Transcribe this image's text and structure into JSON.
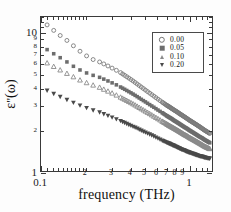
{
  "figure": {
    "background": "#ffffff",
    "frame_color": "#3a3a3a"
  },
  "axes": {
    "x_title": "frequency (THz)",
    "y_title_base": "ε",
    "y_title_prime": "\"",
    "y_title_arg": "(ω)",
    "x_scale": "log",
    "y_scale": "log",
    "xlim": [
      0.1,
      1.45
    ],
    "ylim": [
      1.0,
      13.0
    ],
    "x_major_ticks": [
      {
        "value": 0.1,
        "label": "0.1"
      },
      {
        "value": 1.0,
        "label": "1"
      }
    ],
    "x_minor_ticks": [
      {
        "value": 0.2,
        "label": "2"
      },
      {
        "value": 0.3,
        "label": "3"
      },
      {
        "value": 0.4,
        "label": "4"
      },
      {
        "value": 0.5,
        "label": "5"
      },
      {
        "value": 0.6,
        "label": "6"
      },
      {
        "value": 0.7,
        "label": "7"
      },
      {
        "value": 0.8,
        "label": "8"
      },
      {
        "value": 0.9,
        "label": "9"
      }
    ],
    "y_major_ticks": [
      {
        "value": 1,
        "label": "1"
      },
      {
        "value": 10,
        "label": "10"
      }
    ],
    "y_minor_ticks": [
      {
        "value": 2,
        "label": "2"
      },
      {
        "value": 3,
        "label": "3"
      },
      {
        "value": 4,
        "label": "4"
      },
      {
        "value": 5,
        "label": "5"
      },
      {
        "value": 6,
        "label": "6"
      },
      {
        "value": 7,
        "label": "7"
      },
      {
        "value": 8,
        "label": "8"
      },
      {
        "value": 9,
        "label": "9"
      }
    ]
  },
  "legend": {
    "position": "top-right",
    "entries": [
      {
        "label": "0.00",
        "marker": "open-circle",
        "color": "#7a7a7a"
      },
      {
        "label": "0.05",
        "marker": "filled-square",
        "color": "#6d6d6d"
      },
      {
        "label": "0.10",
        "marker": "open-triangle-up",
        "color": "#8a8a8a"
      },
      {
        "label": "0.20",
        "marker": "filled-triangle-down",
        "color": "#4a4a4a"
      }
    ]
  },
  "chart_data": {
    "type": "scatter",
    "title": "",
    "xlabel": "frequency (THz)",
    "ylabel": "ε\"(ω)",
    "xscale": "log",
    "yscale": "log",
    "xlim": [
      0.1,
      1.45
    ],
    "ylim": [
      1.0,
      13.0
    ],
    "grid": false,
    "legend_position": "top-right",
    "series": [
      {
        "name": "0.00",
        "marker": "open-circle",
        "color": "#7a7a7a",
        "x": [
          0.11,
          0.122,
          0.135,
          0.15,
          0.166,
          0.184,
          0.204,
          0.226,
          0.25,
          0.267,
          0.285,
          0.304,
          0.325,
          0.347,
          0.37,
          0.395,
          0.422,
          0.45,
          0.48,
          0.512,
          0.547,
          0.584,
          0.623,
          0.665,
          0.71,
          0.74,
          0.77,
          0.801,
          0.834,
          0.868,
          0.903,
          0.94,
          0.978,
          1.018,
          1.059,
          1.102,
          1.147,
          1.194,
          1.243,
          1.293,
          1.346,
          1.4
        ],
        "y": [
          11.4,
          10.4,
          9.55,
          8.8,
          8.05,
          7.35,
          6.8,
          6.4,
          6.15,
          5.95,
          5.75,
          5.55,
          5.35,
          5.15,
          4.92,
          4.7,
          4.48,
          4.26,
          4.05,
          3.85,
          3.66,
          3.48,
          3.31,
          3.15,
          3.0,
          2.92,
          2.84,
          2.76,
          2.69,
          2.61,
          2.54,
          2.47,
          2.4,
          2.33,
          2.27,
          2.21,
          2.15,
          2.09,
          2.03,
          1.97,
          1.92,
          1.87
        ]
      },
      {
        "name": "0.05",
        "marker": "filled-square",
        "color": "#6d6d6d",
        "x": [
          0.11,
          0.122,
          0.135,
          0.15,
          0.166,
          0.184,
          0.204,
          0.226,
          0.25,
          0.267,
          0.285,
          0.304,
          0.325,
          0.347,
          0.37,
          0.395,
          0.422,
          0.45,
          0.48,
          0.512,
          0.547,
          0.584,
          0.623,
          0.665,
          0.71,
          0.74,
          0.77,
          0.801,
          0.834,
          0.868,
          0.903,
          0.94,
          0.978,
          1.018,
          1.059,
          1.102,
          1.147,
          1.194,
          1.243,
          1.293,
          1.346,
          1.4
        ],
        "y": [
          7.55,
          7.05,
          6.6,
          6.15,
          5.72,
          5.38,
          5.12,
          4.92,
          4.76,
          4.62,
          4.48,
          4.34,
          4.2,
          4.05,
          3.9,
          3.75,
          3.6,
          3.45,
          3.3,
          3.16,
          3.02,
          2.89,
          2.76,
          2.64,
          2.52,
          2.45,
          2.39,
          2.32,
          2.26,
          2.2,
          2.14,
          2.08,
          2.03,
          1.97,
          1.92,
          1.87,
          1.82,
          1.77,
          1.73,
          1.68,
          1.64,
          1.6
        ]
      },
      {
        "name": "0.10",
        "marker": "open-triangle-up",
        "color": "#8a8a8a",
        "x": [
          0.11,
          0.122,
          0.135,
          0.15,
          0.166,
          0.184,
          0.204,
          0.226,
          0.25,
          0.267,
          0.285,
          0.304,
          0.325,
          0.347,
          0.37,
          0.395,
          0.422,
          0.45,
          0.48,
          0.512,
          0.547,
          0.584,
          0.623,
          0.665,
          0.71,
          0.74,
          0.77,
          0.801,
          0.834,
          0.868,
          0.903,
          0.94,
          0.978,
          1.018,
          1.059,
          1.102,
          1.147,
          1.194,
          1.243,
          1.293,
          1.346,
          1.4
        ],
        "y": [
          6.05,
          5.7,
          5.38,
          5.08,
          4.8,
          4.55,
          4.35,
          4.18,
          4.03,
          3.9,
          3.78,
          3.66,
          3.54,
          3.42,
          3.3,
          3.18,
          3.06,
          2.94,
          2.82,
          2.71,
          2.6,
          2.49,
          2.39,
          2.29,
          2.2,
          2.14,
          2.09,
          2.04,
          1.99,
          1.94,
          1.89,
          1.84,
          1.8,
          1.75,
          1.71,
          1.67,
          1.63,
          1.59,
          1.55,
          1.51,
          1.48,
          1.45
        ]
      },
      {
        "name": "0.20",
        "marker": "filled-triangle-down",
        "color": "#4a4a4a",
        "x": [
          0.11,
          0.122,
          0.135,
          0.15,
          0.166,
          0.184,
          0.204,
          0.226,
          0.25,
          0.267,
          0.285,
          0.304,
          0.325,
          0.347,
          0.37,
          0.395,
          0.422,
          0.45,
          0.48,
          0.512,
          0.547,
          0.584,
          0.623,
          0.665,
          0.71,
          0.74,
          0.77,
          0.801,
          0.834,
          0.868,
          0.903,
          0.94,
          0.978,
          1.018,
          1.059,
          1.102,
          1.147,
          1.194,
          1.243,
          1.293,
          1.346,
          1.4
        ],
        "y": [
          3.82,
          3.62,
          3.44,
          3.27,
          3.12,
          2.98,
          2.86,
          2.75,
          2.66,
          2.58,
          2.51,
          2.44,
          2.37,
          2.3,
          2.23,
          2.16,
          2.09,
          2.03,
          1.96,
          1.9,
          1.84,
          1.78,
          1.72,
          1.66,
          1.61,
          1.58,
          1.55,
          1.52,
          1.49,
          1.46,
          1.43,
          1.41,
          1.38,
          1.36,
          1.34,
          1.32,
          1.3,
          1.28,
          1.27,
          1.25,
          1.24,
          1.23
        ]
      }
    ]
  }
}
